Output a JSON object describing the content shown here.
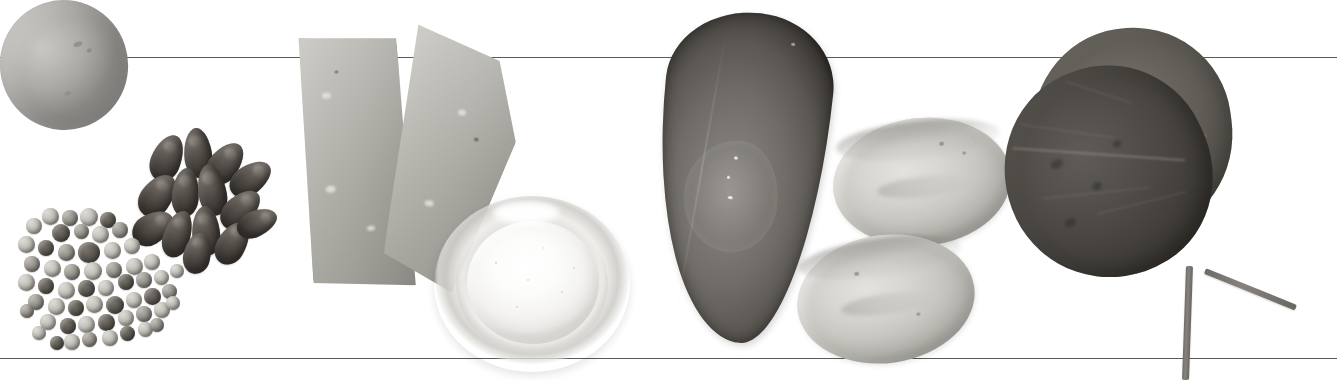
{
  "figure": {
    "background_color": "#ffffff",
    "rule_color": "#5a5a5a",
    "width": 1337,
    "height": 380,
    "alt_text": "Grayscale photographic row of food specimens between two horizontal rules: a whole egg with kidney beans and mixed peas, two cheese wedges beside a glass bowl of salt, a mussel shell with two potato slices, and two overlapping spinach leaves."
  },
  "rules": [
    {
      "name": "top-rule",
      "y": 57
    },
    {
      "name": "bottom-rule",
      "y": 358
    }
  ],
  "groups": [
    {
      "id": "group-1",
      "label": "Egg, kidney beans and mixed peas",
      "items": [
        {
          "name": "egg",
          "label": "Whole egg",
          "tone": "#b5b3ae"
        },
        {
          "name": "kidney-beans",
          "label": "Kidney beans",
          "tone": "#4a4540",
          "count": 14
        },
        {
          "name": "mixed-peas",
          "label": "Mixed peas and lentils",
          "tone": "#9a978f",
          "count": 56
        }
      ]
    },
    {
      "id": "group-2",
      "label": "Cheese wedges and bowl of salt",
      "items": [
        {
          "name": "cheese-wedge-left",
          "label": "Cheese wedge (left)",
          "tone": "#b7b5ae"
        },
        {
          "name": "cheese-wedge-right",
          "label": "Cheese wedge (right)",
          "tone": "#adaba4"
        },
        {
          "name": "salt-bowl",
          "label": "Glass bowl of salt",
          "tone": "#f5f4f2"
        }
      ]
    },
    {
      "id": "group-3",
      "label": "Mussel shell and potato slices",
      "items": [
        {
          "name": "mussel",
          "label": "Mussel shell",
          "tone": "#6f6c67"
        },
        {
          "name": "potato-slice-upper",
          "label": "Potato slice (upper)",
          "tone": "#d4d2cd"
        },
        {
          "name": "potato-slice-lower",
          "label": "Potato slice (lower)",
          "tone": "#d0cec9"
        }
      ]
    },
    {
      "id": "group-4",
      "label": "Spinach leaves",
      "items": [
        {
          "name": "leaf-back",
          "label": "Spinach leaf (back)",
          "tone": "#63605a"
        },
        {
          "name": "leaf-front",
          "label": "Spinach leaf (front)",
          "tone": "#4a4742"
        },
        {
          "name": "leaf-stem-vertical",
          "label": "Leaf stem (vertical)",
          "tone": "#7b7873"
        },
        {
          "name": "leaf-stem-diagonal",
          "label": "Leaf stem (diagonal)",
          "tone": "#7b7873"
        }
      ]
    }
  ]
}
